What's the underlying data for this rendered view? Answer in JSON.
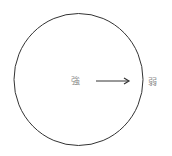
{
  "diagram": {
    "center_label": "強",
    "outer_label": "弱",
    "arrow_direction": "center-to-edge",
    "colors": {
      "stroke": "#333333",
      "text": "#8a8a8a",
      "background": "#ffffff"
    }
  }
}
